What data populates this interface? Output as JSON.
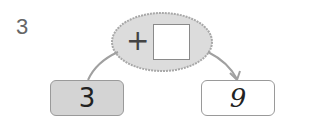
{
  "problem": {
    "number": "3",
    "operator": "+",
    "answer_value": "",
    "start_value": "3",
    "result_value": "9"
  },
  "colors": {
    "ellipse_fill": "#dcdcdc",
    "ellipse_stroke": "#a8a8a8",
    "start_box_fill": "#d4d4d4",
    "result_box_fill": "#ffffff",
    "arrow_stroke": "#a0a0a0"
  }
}
